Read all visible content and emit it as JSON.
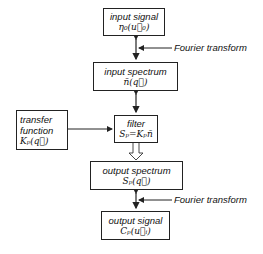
{
  "diagram": {
    "boxes": {
      "input_signal": {
        "title": "input signal",
        "formula": "η₀(u⃗₀)"
      },
      "input_spectrum": {
        "title": "input spectrum",
        "formula": "ñ(q⃗)"
      },
      "transfer_function": {
        "line1": "transfer",
        "line2": "function",
        "formula": "Kₚ(q⃗)"
      },
      "filter": {
        "title": "filter",
        "formula": "Sₚ=Kₚñ"
      },
      "output_spectrum": {
        "title": "output spectrum",
        "formula": "Sₚ(q⃗)"
      },
      "output_signal": {
        "title": "output signal",
        "formula": "Cₚ(u⃗ᵢ)"
      }
    },
    "annotations": {
      "fourier_top": "Fourier transform",
      "fourier_bottom": "Fourier transform"
    },
    "colors": {
      "stroke": "#222222",
      "background": "#ffffff"
    }
  }
}
